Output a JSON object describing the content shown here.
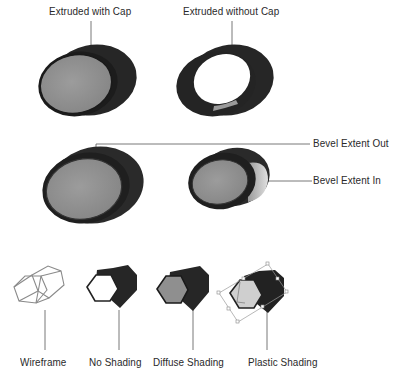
{
  "figure": {
    "top_row": {
      "labels": [
        "Extruded with Cap",
        "Extruded without Cap"
      ]
    },
    "middle_row": {
      "labels": [
        "Bevel Extent Out",
        "Bevel Extent In"
      ]
    },
    "bottom_row": {
      "labels": [
        "Wireframe",
        "No Shading",
        "Diffuse Shading",
        "Plastic Shading"
      ]
    },
    "colors": {
      "dark_body": "#262626",
      "cap_gray": "#8f8f8f",
      "light_face": "#cfcfcf",
      "leader_line": "#555555"
    }
  }
}
